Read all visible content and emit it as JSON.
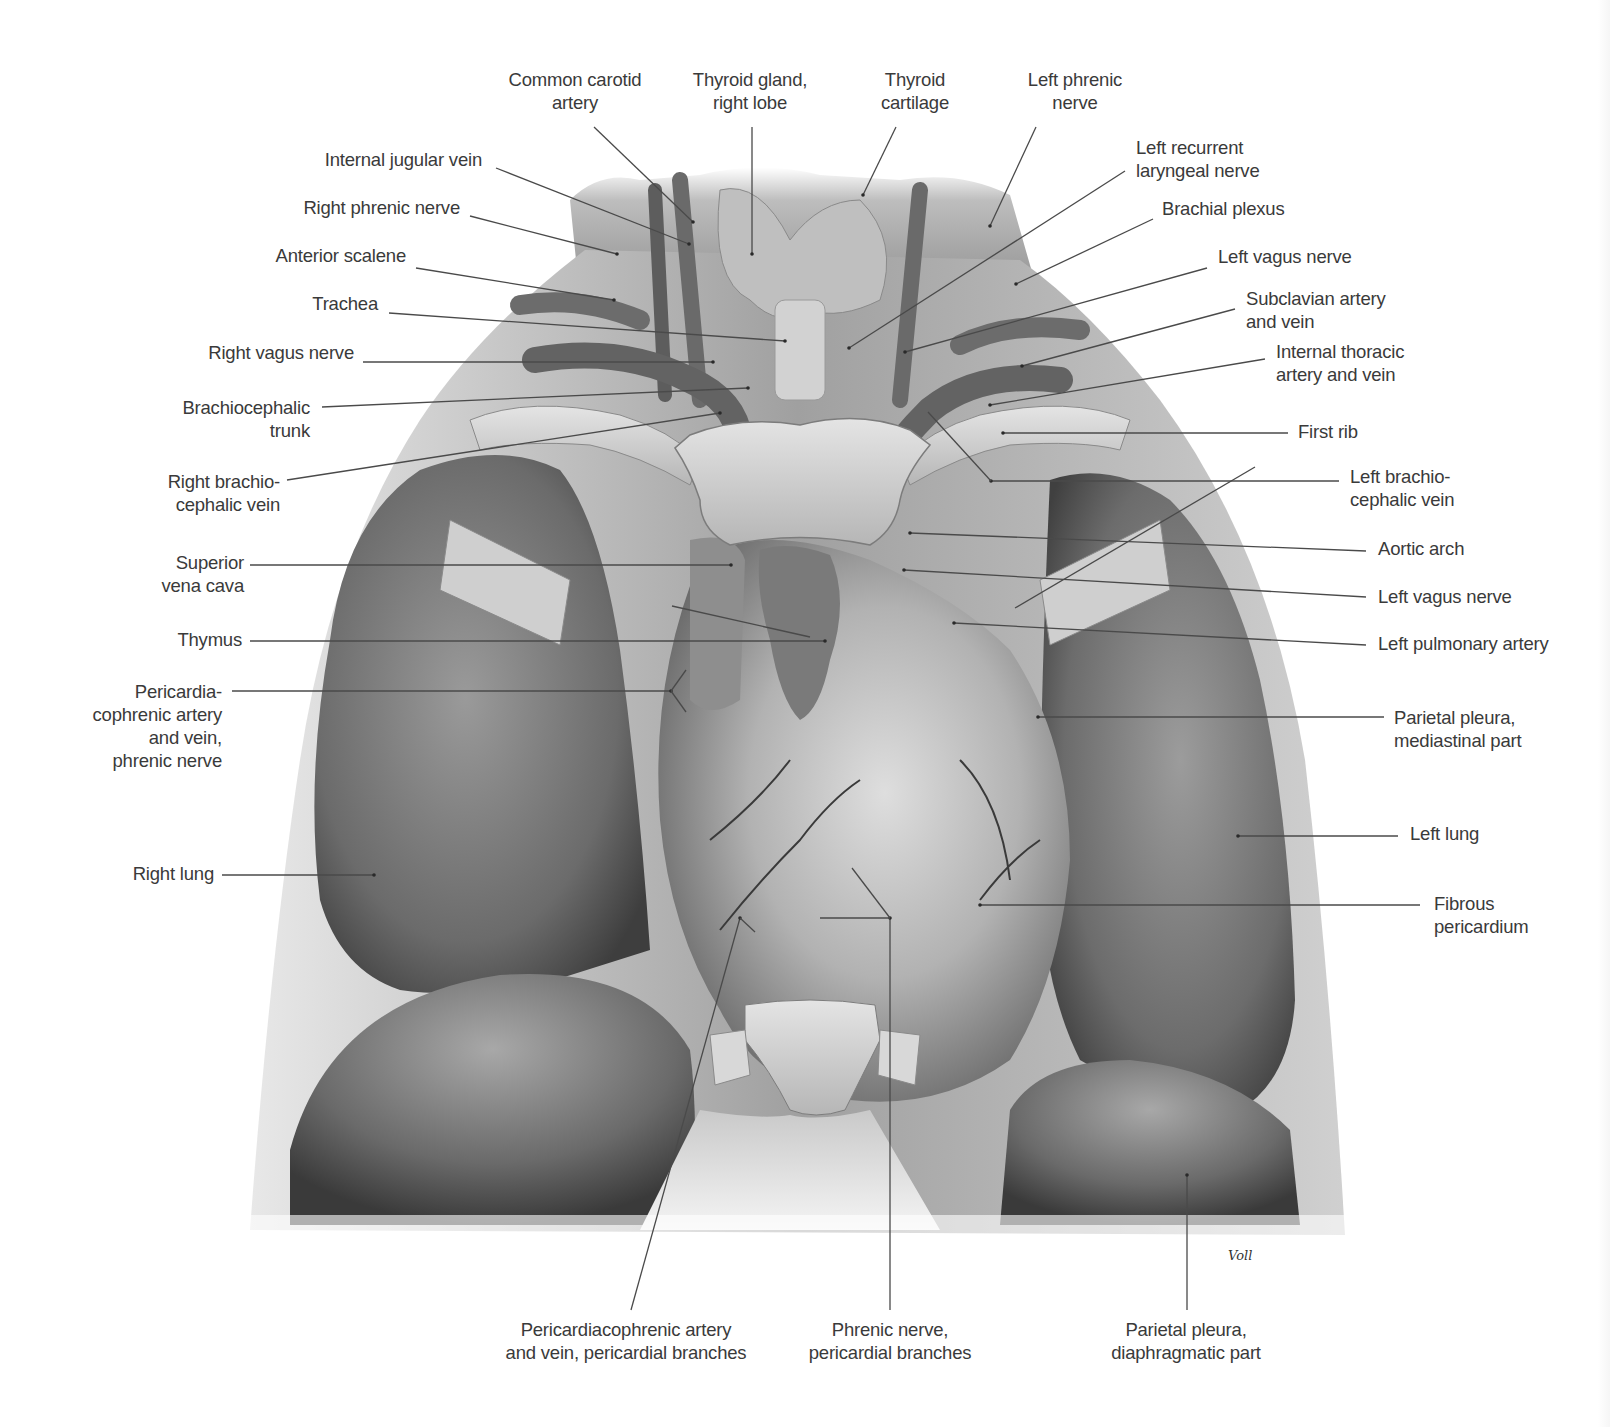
{
  "figure": {
    "signature": "Voll",
    "colors": {
      "background": "#ffffff",
      "label_text": "#3a3a3a",
      "leader_line": "#4a4a4a",
      "tissue_dark": "#5a5a5a",
      "tissue_mid": "#8c8c8c",
      "tissue_light": "#c8c8c8",
      "bone": "#d4d4d4"
    }
  },
  "labels": [
    {
      "id": "common-carotid-artery",
      "lines": [
        "Common carotid",
        "artery"
      ],
      "x": 490,
      "y": 68,
      "w": 170,
      "align": "center",
      "leader": [
        [
          594,
          127
        ],
        [
          693,
          222
        ]
      ]
    },
    {
      "id": "thyroid-gland-right-lobe",
      "lines": [
        "Thyroid gland,",
        "right lobe"
      ],
      "x": 670,
      "y": 68,
      "w": 160,
      "align": "center",
      "leader": [
        [
          752,
          127
        ],
        [
          752,
          254
        ]
      ]
    },
    {
      "id": "thyroid-cartilage",
      "lines": [
        "Thyroid",
        "cartilage"
      ],
      "x": 860,
      "y": 68,
      "w": 110,
      "align": "center",
      "leader": [
        [
          896,
          127
        ],
        [
          863,
          195
        ]
      ]
    },
    {
      "id": "left-phrenic-nerve",
      "lines": [
        "Left phrenic",
        "nerve"
      ],
      "x": 1010,
      "y": 68,
      "w": 130,
      "align": "center",
      "leader": [
        [
          1036,
          127
        ],
        [
          990,
          226
        ]
      ]
    },
    {
      "id": "internal-jugular-vein",
      "lines": [
        "Internal jugular vein"
      ],
      "x": 300,
      "y": 148,
      "w": 182,
      "align": "right",
      "leader": [
        [
          496,
          168
        ],
        [
          689,
          244
        ]
      ]
    },
    {
      "id": "left-recurrent-laryngeal-nerve",
      "lines": [
        "Left recurrent",
        "laryngeal nerve"
      ],
      "x": 1136,
      "y": 136,
      "w": 160,
      "align": "left",
      "leader": [
        [
          1125,
          171
        ],
        [
          849,
          348
        ]
      ]
    },
    {
      "id": "right-phrenic-nerve",
      "lines": [
        "Right phrenic nerve"
      ],
      "x": 288,
      "y": 196,
      "w": 172,
      "align": "right",
      "leader": [
        [
          470,
          216
        ],
        [
          617,
          254
        ]
      ]
    },
    {
      "id": "brachial-plexus",
      "lines": [
        "Brachial plexus"
      ],
      "x": 1162,
      "y": 197,
      "w": 140,
      "align": "left",
      "leader": [
        [
          1153,
          219
        ],
        [
          1016,
          284
        ]
      ]
    },
    {
      "id": "anterior-scalene",
      "lines": [
        "Anterior scalene"
      ],
      "x": 264,
      "y": 244,
      "w": 142,
      "align": "right",
      "leader": [
        [
          416,
          268
        ],
        [
          614,
          300
        ]
      ]
    },
    {
      "id": "left-vagus-nerve-upper",
      "lines": [
        "Left vagus nerve"
      ],
      "x": 1218,
      "y": 245,
      "w": 150,
      "align": "left",
      "leader": [
        [
          1207,
          268
        ],
        [
          905,
          352
        ]
      ]
    },
    {
      "id": "trachea",
      "lines": [
        "Trachea"
      ],
      "x": 310,
      "y": 292,
      "w": 68,
      "align": "right",
      "leader": [
        [
          389,
          313
        ],
        [
          785,
          341
        ]
      ]
    },
    {
      "id": "subclavian-artery-and-vein",
      "lines": [
        "Subclavian artery",
        "and vein"
      ],
      "x": 1246,
      "y": 287,
      "w": 160,
      "align": "left",
      "leader": [
        [
          1235,
          309
        ],
        [
          1022,
          366
        ]
      ]
    },
    {
      "id": "right-vagus-nerve",
      "lines": [
        "Right vagus nerve"
      ],
      "x": 196,
      "y": 341,
      "w": 158,
      "align": "right",
      "leader": [
        [
          363,
          362
        ],
        [
          713,
          362
        ]
      ]
    },
    {
      "id": "internal-thoracic-artery-and-vein",
      "lines": [
        "Internal thoracic",
        "artery and vein"
      ],
      "x": 1276,
      "y": 340,
      "w": 150,
      "align": "left",
      "leader": [
        [
          1265,
          359
        ],
        [
          990,
          405
        ]
      ]
    },
    {
      "id": "brachiocephalic-trunk",
      "lines": [
        "Brachiocephalic",
        "trunk"
      ],
      "x": 160,
      "y": 396,
      "w": 150,
      "align": "right",
      "leader": [
        [
          322,
          407
        ],
        [
          748,
          388
        ]
      ]
    },
    {
      "id": "first-rib",
      "lines": [
        "First rib"
      ],
      "x": 1298,
      "y": 420,
      "w": 80,
      "align": "left",
      "leader": [
        [
          1288,
          433
        ],
        [
          1003,
          433
        ]
      ]
    },
    {
      "id": "right-brachiocephalic-vein",
      "lines": [
        "Right brachio-",
        "cephalic vein"
      ],
      "x": 150,
      "y": 470,
      "w": 130,
      "align": "right",
      "leader": [
        [
          287,
          480
        ],
        [
          720,
          413
        ]
      ]
    },
    {
      "id": "left-brachiocephalic-vein",
      "lines": [
        "Left brachio-",
        "cephalic vein"
      ],
      "x": 1350,
      "y": 465,
      "w": 130,
      "align": "left",
      "leader": [
        [
          1339,
          481
        ],
        [
          991,
          481
        ]
      ]
    },
    {
      "id": "aortic-arch",
      "lines": [
        "Aortic arch"
      ],
      "x": 1378,
      "y": 537,
      "w": 100,
      "align": "left",
      "leader": [
        [
          1366,
          551
        ],
        [
          910,
          533
        ]
      ]
    },
    {
      "id": "superior-vena-cava",
      "lines": [
        "Superior",
        "vena cava"
      ],
      "x": 160,
      "y": 551,
      "w": 84,
      "align": "right",
      "leader": [
        [
          250,
          565
        ],
        [
          731,
          565
        ]
      ]
    },
    {
      "id": "left-vagus-nerve-lower",
      "lines": [
        "Left vagus nerve"
      ],
      "x": 1378,
      "y": 585,
      "w": 150,
      "align": "left",
      "leader": [
        [
          1366,
          597
        ],
        [
          904,
          570
        ]
      ]
    },
    {
      "id": "thymus",
      "lines": [
        "Thymus"
      ],
      "x": 172,
      "y": 628,
      "w": 70,
      "align": "right",
      "leader": [
        [
          250,
          641
        ],
        [
          825,
          641
        ]
      ]
    },
    {
      "id": "left-pulmonary-artery",
      "lines": [
        "Left pulmonary artery"
      ],
      "x": 1378,
      "y": 632,
      "w": 190,
      "align": "left",
      "leader": [
        [
          1366,
          645
        ],
        [
          954,
          623
        ]
      ]
    },
    {
      "id": "pericardiacophrenic-artery-vein-phrenic-nerve",
      "lines": [
        "Pericardia-",
        "cophrenic artery",
        "and vein,",
        "phrenic nerve"
      ],
      "x": 70,
      "y": 680,
      "w": 152,
      "align": "right",
      "leader": [
        [
          232,
          691
        ],
        [
          671,
          691
        ]
      ]
    },
    {
      "id": "parietal-pleura-mediastinal-part",
      "lines": [
        "Parietal pleura,",
        "mediastinal part"
      ],
      "x": 1394,
      "y": 706,
      "w": 150,
      "align": "left",
      "leader": [
        [
          1384,
          717
        ],
        [
          1038,
          717
        ]
      ]
    },
    {
      "id": "left-lung",
      "lines": [
        "Left lung"
      ],
      "x": 1410,
      "y": 822,
      "w": 90,
      "align": "left",
      "leader": [
        [
          1398,
          836
        ],
        [
          1238,
          836
        ]
      ]
    },
    {
      "id": "right-lung",
      "lines": [
        "Right lung"
      ],
      "x": 122,
      "y": 862,
      "w": 92,
      "align": "right",
      "leader": [
        [
          222,
          875
        ],
        [
          374,
          875
        ]
      ]
    },
    {
      "id": "fibrous-pericardium",
      "lines": [
        "Fibrous",
        "pericardium"
      ],
      "x": 1434,
      "y": 892,
      "w": 110,
      "align": "left",
      "leader": [
        [
          1420,
          905
        ],
        [
          980,
          905
        ]
      ]
    },
    {
      "id": "pericardiacophrenic-artery-vein-pericardial-branches",
      "lines": [
        "Pericardiacophrenic artery",
        "and vein, pericardial branches"
      ],
      "x": 486,
      "y": 1318,
      "w": 280,
      "align": "center",
      "leader": [
        [
          631,
          1310
        ],
        [
          740,
          918
        ]
      ]
    },
    {
      "id": "phrenic-nerve-pericardial-branches",
      "lines": [
        "Phrenic nerve,",
        "pericardial branches"
      ],
      "x": 790,
      "y": 1318,
      "w": 200,
      "align": "center",
      "leader": [
        [
          890,
          1310
        ],
        [
          890,
          918
        ]
      ]
    },
    {
      "id": "parietal-pleura-diaphragmatic-part",
      "lines": [
        "Parietal pleura,",
        "diaphragmatic part"
      ],
      "x": 1096,
      "y": 1318,
      "w": 180,
      "align": "center",
      "leader": [
        [
          1187,
          1310
        ],
        [
          1187,
          1175
        ]
      ]
    }
  ],
  "extra_leaders": [
    [
      [
        671,
        691
      ],
      [
        686,
        670
      ]
    ],
    [
      [
        671,
        691
      ],
      [
        686,
        712
      ]
    ],
    [
      [
        672,
        606
      ],
      [
        810,
        637
      ]
    ],
    [
      [
        740,
        918
      ],
      [
        755,
        932
      ]
    ],
    [
      [
        890,
        918
      ],
      [
        852,
        868
      ]
    ],
    [
      [
        890,
        918
      ],
      [
        820,
        918
      ]
    ],
    [
      [
        991,
        481
      ],
      [
        928,
        412
      ]
    ],
    [
      [
        1015,
        608
      ],
      [
        1255,
        467
      ]
    ]
  ]
}
